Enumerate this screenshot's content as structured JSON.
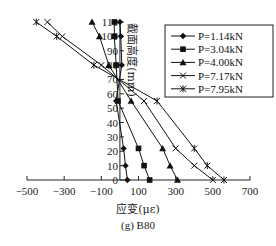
{
  "chart_data": {
    "type": "line",
    "title": "",
    "caption": "(g) B80",
    "xlabel": "应变(με)",
    "ylabel": "截面高度(mm)",
    "xlim": [
      -500,
      700
    ],
    "ylim": [
      0,
      110
    ],
    "x_ticks": [
      -500,
      -300,
      -100,
      100,
      300,
      500,
      700
    ],
    "y_ticks": [
      0,
      10,
      20,
      30,
      40,
      50,
      60,
      70,
      80,
      90,
      100,
      110
    ],
    "grid": false,
    "legend_position": "upper right",
    "series": [
      {
        "name": "P=1.14kN",
        "marker": "diamond",
        "points": [
          [
            40,
            0
          ],
          [
            30,
            10
          ],
          [
            20,
            22
          ],
          [
            -20,
            55
          ],
          [
            10,
            80
          ],
          [
            5,
            100
          ],
          [
            0,
            110
          ]
        ]
      },
      {
        "name": "P=3.04kN",
        "marker": "square",
        "points": [
          [
            160,
            0
          ],
          [
            130,
            10
          ],
          [
            100,
            22
          ],
          [
            -10,
            55
          ],
          [
            -20,
            80
          ],
          [
            -30,
            100
          ],
          [
            -30,
            110
          ]
        ]
      },
      {
        "name": "P=4.00kN",
        "marker": "triangle",
        "points": [
          [
            310,
            0
          ],
          [
            270,
            10
          ],
          [
            230,
            22
          ],
          [
            60,
            55
          ],
          [
            -60,
            80
          ],
          [
            -110,
            100
          ],
          [
            -150,
            110
          ]
        ]
      },
      {
        "name": "P=7.17kN",
        "marker": "x",
        "points": [
          [
            500,
            0
          ],
          [
            400,
            10
          ],
          [
            300,
            22
          ],
          [
            130,
            55
          ],
          [
            -100,
            80
          ],
          [
            -310,
            100
          ],
          [
            -390,
            110
          ]
        ]
      },
      {
        "name": "P=7.95kN",
        "marker": "asterisk",
        "points": [
          [
            560,
            0
          ],
          [
            470,
            10
          ],
          [
            400,
            22
          ],
          [
            200,
            55
          ],
          [
            -140,
            80
          ],
          [
            -340,
            100
          ],
          [
            -450,
            110
          ]
        ]
      }
    ]
  }
}
